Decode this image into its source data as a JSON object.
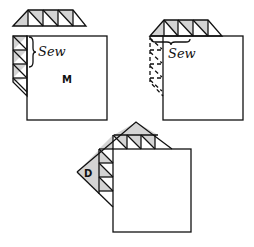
{
  "diagram": {
    "title": "",
    "colors": {
      "line": "#111111",
      "shading": "#d4d4d4",
      "background": "#ffffff"
    },
    "panels": [
      {
        "id": "step-1",
        "sew_label": "Sew",
        "piece_label": "M",
        "description": "Triangle strip sewn to left edge of square M; second strip shown above"
      },
      {
        "id": "step-2",
        "sew_label": "Sew",
        "description": "Top strip sewn along top edge; previous left strip shown dashed"
      },
      {
        "id": "step-3",
        "piece_label": "D",
        "description": "Completed corner with large triangles D added"
      }
    ]
  }
}
